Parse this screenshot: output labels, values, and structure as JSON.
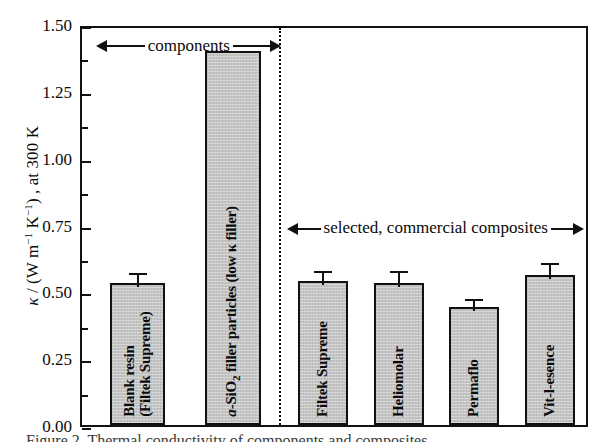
{
  "figure": {
    "caption_fragment": "Figure 2.   Thermal conductivity of components and composites"
  },
  "axes": {
    "y_title_prefix": "κ / (W m",
    "y_title_exp1": "−1",
    "y_title_mid": " K",
    "y_title_exp2": "−1",
    "y_title_suffix": ") , at 300 K",
    "y_ticks": [
      "1.50",
      "1.25",
      "1.00",
      "0.75",
      "0.50",
      "0.25",
      "0.00"
    ],
    "y_min": 0.0,
    "y_max": 1.5,
    "y_tick_step": 0.25,
    "y_minor_step": 0.125,
    "grid": false
  },
  "annotations": [
    {
      "name": "components-span",
      "text": "components"
    },
    {
      "name": "composites-span",
      "text": "selected, commercial composites"
    }
  ],
  "chart_data": {
    "type": "bar",
    "title": "",
    "xlabel": "",
    "ylabel": "κ / (W m−1 K−1) , at 300 K",
    "ylim": [
      0.0,
      1.5
    ],
    "ytick_step": 0.25,
    "grid": false,
    "legend": "none",
    "groups": [
      {
        "name": "components",
        "members": [
          "Blank resin (Filtek Supreme)",
          "a-SiO2 filler particles (low κ filler)"
        ]
      },
      {
        "name": "selected, commercial composites",
        "members": [
          "Filtek Supreme",
          "Heliomolar",
          "Permaflo",
          "Vit-l-esence"
        ]
      }
    ],
    "categories": [
      "Blank resin (Filtek Supreme)",
      "a-SiO2 filler particles (low κ filler)",
      "Filtek Supreme",
      "Heliomolar",
      "Permaflo",
      "Vit-l-esence"
    ],
    "values": [
      0.53,
      1.4,
      0.54,
      0.53,
      0.44,
      0.56
    ],
    "errors": [
      0.055,
      0.0,
      0.05,
      0.06,
      0.045,
      0.06
    ],
    "bar_color": "#c4c4c4",
    "edge_color": "#111111"
  },
  "bars": [
    {
      "name": "bar-blank-resin",
      "label_line1": "Blank resin",
      "label_line2": "(Filtek Supreme)",
      "value": 0.53,
      "error": 0.055,
      "x_pct": 7.0,
      "width_pct": 14.0,
      "two_line": true,
      "italic_prefix": ""
    },
    {
      "name": "bar-a-sio2-filler",
      "label_line1": "a-SiO2 filler particles (low κ filler)",
      "label_line2": "",
      "value": 1.4,
      "error": 0.0,
      "x_pct": 31.0,
      "width_pct": 14.0,
      "two_line": false,
      "italic_prefix": "a"
    },
    {
      "name": "bar-filtek-supreme",
      "label_line1": "Filtek Supreme",
      "label_line2": "",
      "value": 0.54,
      "error": 0.05,
      "x_pct": 54.5,
      "width_pct": 12.6,
      "two_line": false,
      "italic_prefix": ""
    },
    {
      "name": "bar-heliomolar",
      "label_line1": "Heliomolar",
      "label_line2": "",
      "value": 0.53,
      "error": 0.06,
      "x_pct": 73.5,
      "width_pct": 12.6,
      "two_line": false,
      "italic_prefix": ""
    },
    {
      "name": "bar-permaflo",
      "label_line1": "Permaflo",
      "label_line2": "",
      "value": 0.44,
      "error": 0.045,
      "x_pct": 92.5,
      "width_pct": 12.6,
      "two_line": false,
      "italic_prefix": ""
    },
    {
      "name": "bar-vit-l-esence",
      "label_line1": "Vit-l-esence",
      "label_line2": "",
      "value": 0.56,
      "error": 0.06,
      "x_pct": 111.5,
      "width_pct": 12.6,
      "two_line": false,
      "italic_prefix": ""
    }
  ]
}
